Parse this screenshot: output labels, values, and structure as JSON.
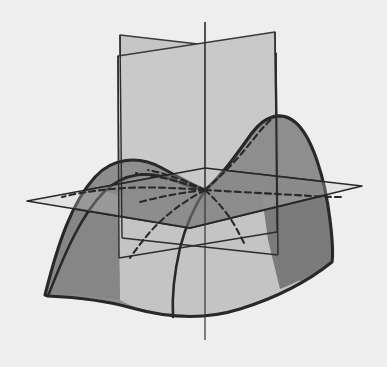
{
  "figure": {
    "kind": "mathematical-3d-diagram",
    "width": 387,
    "height": 367
  },
  "palette": {
    "background": "#eeeeee",
    "plane_light": "#c6c6c6",
    "plane_light_front": "#c9c9c9",
    "surface_lit": "#8e8e8e",
    "surface_shadow": "#6e6e6e",
    "surface_mid": "#989898",
    "outline": "#282828",
    "outline_soft": "#3a3a3a",
    "axis": "#333333"
  },
  "strokes": {
    "silhouette_width": 3.1,
    "plane_edge_width": 1.5,
    "axis_width": 1.2,
    "hidden_width": 2.1,
    "hidden_dash": "6,4"
  },
  "geometry": {
    "saddle_point": {
      "x": 205,
      "y": 190
    },
    "vertical_axis": {
      "x": 205,
      "y_top": 22,
      "y_bottom": 340
    },
    "horizontal_plane": {
      "left_vertex": {
        "x": 27,
        "y": 201
      },
      "top_vertex": {
        "x": 205,
        "y": 168
      },
      "right_vertex": {
        "x": 362,
        "y": 186
      },
      "bottom_vertex": {
        "x": 190,
        "y": 228
      }
    },
    "plane_a": {
      "label": "vertical-plane-back-left",
      "corners": [
        {
          "x": 120,
          "y": 35
        },
        {
          "x": 276,
          "y": 53
        },
        {
          "x": 278,
          "y": 255
        },
        {
          "x": 122,
          "y": 238
        }
      ]
    },
    "plane_b": {
      "label": "vertical-plane-front-right",
      "corners": [
        {
          "x": 118,
          "y": 56
        },
        {
          "x": 275,
          "y": 32
        },
        {
          "x": 277,
          "y": 232
        },
        {
          "x": 119,
          "y": 258
        }
      ]
    },
    "surface": {
      "left_peak": {
        "x": 114,
        "y": 163
      },
      "left_tip": {
        "x": 45,
        "y": 295
      },
      "right_peak": {
        "x": 277,
        "y": 118
      },
      "right_edge": {
        "x": 332,
        "y": 262
      },
      "front_low": {
        "x": 200,
        "y": 318
      }
    }
  },
  "elements": {
    "background_name": "figure-background",
    "surface_name": "saddle-surface",
    "plane_h_name": "horizontal-plane",
    "plane_a_name": "vertical-plane-back",
    "plane_b_name": "vertical-plane-front",
    "axis_name": "vertical-axis",
    "hidden_name": "hidden-intersection-curves"
  },
  "chart_data": {
    "type": "line",
    "xlabel": "x",
    "ylabel": "y",
    "zlabel": "z",
    "series": [
      {
        "name": "surface silhouette (left lobe)",
        "points": [
          [
            45,
            295
          ],
          [
            62,
            236
          ],
          [
            86,
            192
          ],
          [
            114,
            163
          ],
          [
            146,
            164
          ],
          [
            176,
            180
          ],
          [
            205,
            190
          ]
        ]
      },
      {
        "name": "surface silhouette (right lobe)",
        "points": [
          [
            205,
            190
          ],
          [
            229,
            172
          ],
          [
            248,
            142
          ],
          [
            265,
            121
          ],
          [
            282,
            117
          ],
          [
            303,
            134
          ],
          [
            318,
            168
          ],
          [
            328,
            212
          ],
          [
            332,
            262
          ]
        ]
      },
      {
        "name": "front lower boundary",
        "points": [
          [
            48,
            296
          ],
          [
            96,
            292
          ],
          [
            150,
            310
          ],
          [
            200,
            318
          ],
          [
            252,
            306
          ],
          [
            296,
            283
          ],
          [
            332,
            262
          ]
        ]
      },
      {
        "name": "section curve through saddle (hidden, up-right)",
        "points": [
          [
            205,
            190
          ],
          [
            224,
            176
          ],
          [
            242,
            158
          ],
          [
            258,
            138
          ],
          [
            272,
            122
          ]
        ]
      },
      {
        "name": "section curve through saddle (hidden, down-left)",
        "points": [
          [
            205,
            190
          ],
          [
            186,
            199
          ],
          [
            166,
            212
          ],
          [
            146,
            230
          ],
          [
            131,
            250
          ]
        ]
      },
      {
        "name": "section curve (hidden, flat toward left vertex)",
        "points": [
          [
            205,
            190
          ],
          [
            170,
            189
          ],
          [
            128,
            189
          ],
          [
            92,
            192
          ],
          [
            62,
            197
          ]
        ]
      },
      {
        "name": "section curve (hidden, flat toward right vertex)",
        "points": [
          [
            205,
            190
          ],
          [
            244,
            193
          ],
          [
            284,
            196
          ],
          [
            320,
            197
          ]
        ]
      },
      {
        "name": "section curve (hidden, down-right fork)",
        "points": [
          [
            205,
            190
          ],
          [
            219,
            200
          ],
          [
            231,
            213
          ],
          [
            240,
            228
          ]
        ]
      },
      {
        "name": "section curve (hidden, up-left fork)",
        "points": [
          [
            205,
            190
          ],
          [
            188,
            186
          ],
          [
            170,
            180
          ],
          [
            152,
            176
          ]
        ]
      }
    ],
    "grid": false,
    "legend": "none"
  }
}
